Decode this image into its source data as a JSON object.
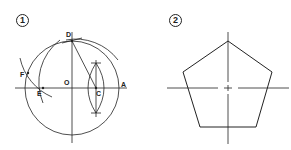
{
  "panels": [
    {
      "step": "1",
      "labels": {
        "D": "D",
        "F": "F",
        "E": "E",
        "O": "O",
        "C": "C",
        "A": "A"
      },
      "description": "Construction of a regular pentagon inscribed in a circle"
    },
    {
      "step": "2",
      "description": "Resulting regular pentagon with centerlines"
    }
  ],
  "colors": {
    "line": "#222222",
    "background": "#ffffff"
  }
}
